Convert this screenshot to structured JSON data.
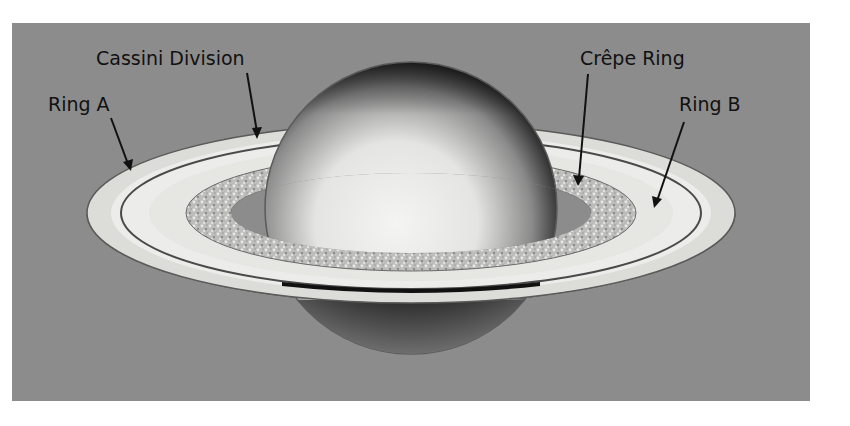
{
  "figure": {
    "colors": {
      "background": "#8c8c8c",
      "page": "#ffffff",
      "ring_light": "#e6e6e2",
      "ring_shadow": "#1a1a1a",
      "label": "#111111"
    }
  },
  "labels": {
    "cassini_division": "Cassini Division",
    "ring_a": "Ring A",
    "crepe_ring": "Crêpe Ring",
    "ring_b": "Ring B"
  }
}
